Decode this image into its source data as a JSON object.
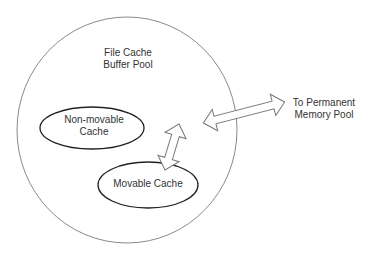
{
  "diagram": {
    "pool": {
      "line1": "File Cache",
      "line2": "Buffer Pool"
    },
    "non_movable": {
      "line1": "Non-movable",
      "line2": "Cache"
    },
    "movable": {
      "label": "Movable Cache"
    },
    "target": {
      "line1": "To Permanent",
      "line2": "Memory Pool"
    }
  },
  "colors": {
    "outline": "#888888",
    "ellipse_stroke": "#222222",
    "text": "#333333",
    "background": "#ffffff"
  }
}
